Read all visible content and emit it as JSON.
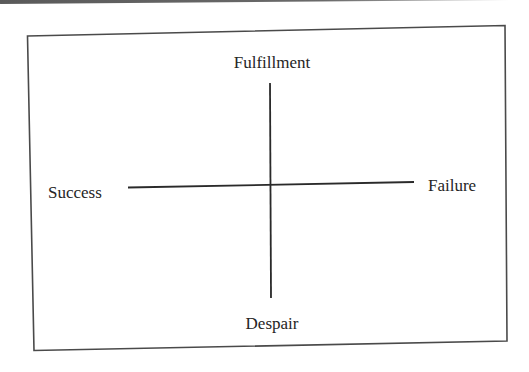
{
  "diagram": {
    "type": "quadrant-axes",
    "labels": {
      "top": "Fulfillment",
      "bottom": "Despair",
      "left": "Success",
      "right": "Failure"
    },
    "colors": {
      "line": "#2a2a2a",
      "frame": "#4a4a4a",
      "text": "#252525",
      "background": "#ffffff"
    }
  }
}
